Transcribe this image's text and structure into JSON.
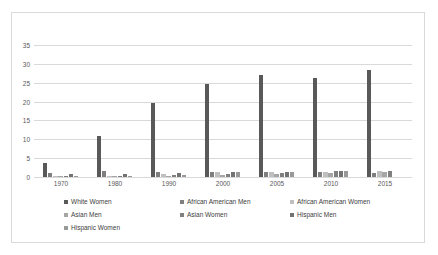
{
  "chart_data": {
    "type": "bar",
    "title": "",
    "xlabel": "",
    "ylabel": "",
    "ylim": [
      0,
      35
    ],
    "ytick_values": [
      0,
      5,
      10,
      15,
      20,
      25,
      30,
      35
    ],
    "ytick_labels": [
      "0",
      "5",
      "10",
      "15",
      "20",
      "25",
      "30",
      "35"
    ],
    "grid": true,
    "legend_position": "bottom",
    "x": [
      1967,
      1968,
      1969,
      1970,
      1971,
      1972,
      1973,
      1974,
      1976,
      1977,
      1978,
      1979,
      1980,
      1981,
      1982,
      1983,
      1986,
      1987,
      1988,
      1989,
      1990,
      1991,
      1992,
      1993,
      1996,
      1997,
      1998,
      1999,
      2000,
      2001,
      2002,
      2003,
      2004,
      2005,
      2006,
      2007,
      2008,
      2009,
      2010,
      2011,
      2012,
      2013,
      2014,
      2015,
      2016,
      2017
    ],
    "xtick_labels": [
      "1970",
      "1980",
      "1990",
      "2000",
      "2005",
      "2010",
      "2015"
    ],
    "xtick_positions": [
      1970,
      1980,
      1990,
      2000,
      2005,
      2010,
      2015
    ],
    "series": [
      {
        "name": "White Women",
        "color": "#595959",
        "values": [
          3.7,
          0,
          0,
          0,
          0,
          0,
          0,
          0,
          11.0,
          0,
          0,
          0,
          0,
          0,
          0,
          0,
          19.7,
          0,
          0,
          0,
          0,
          0,
          0,
          0,
          24.7,
          0,
          0,
          0,
          0,
          0,
          0,
          27.0,
          0,
          0,
          0,
          0,
          26.3,
          0,
          0,
          0,
          0,
          28.3,
          0,
          0,
          0,
          0
        ]
      },
      {
        "name": "African American Men",
        "color": "#7f7f7f",
        "values": [
          0,
          1.0,
          0,
          0,
          0,
          0,
          0,
          0,
          0,
          1.5,
          0,
          0,
          0,
          0,
          0,
          0,
          0,
          1.3,
          0,
          0,
          0,
          0,
          0,
          0,
          0,
          1.3,
          0,
          0,
          0,
          0,
          0,
          0,
          1.2,
          0,
          0,
          0,
          0,
          1.2,
          0,
          0,
          0,
          0,
          1.1,
          0,
          0,
          0
        ]
      },
      {
        "name": "African American Women",
        "color": "#bfbfbf",
        "values": [
          0,
          0,
          0.2,
          0,
          0,
          0,
          0,
          0,
          0,
          0,
          0.3,
          0,
          0,
          0,
          0,
          0,
          0,
          0,
          0.8,
          0,
          0,
          0,
          0,
          0,
          0,
          0,
          1.2,
          0,
          0,
          0,
          0,
          0,
          0,
          1.3,
          0,
          0,
          0,
          0,
          1.4,
          0,
          0,
          0,
          0,
          1.5,
          0,
          0
        ]
      },
      {
        "name": "Asian Men",
        "color": "#a6a6a6",
        "values": [
          0,
          0,
          0,
          0.2,
          0,
          0,
          0,
          0,
          0,
          0,
          0,
          0.3,
          0,
          0,
          0,
          0,
          0,
          0,
          0,
          0.4,
          0,
          0,
          0,
          0,
          0,
          0,
          0,
          0.6,
          0,
          0,
          0,
          0,
          0,
          0,
          0.9,
          0,
          0,
          0,
          0,
          1.0,
          0,
          0,
          0,
          0,
          1.2,
          0
        ]
      },
      {
        "name": "Asian Women",
        "color": "#808080",
        "values": [
          0,
          0,
          0,
          0,
          0.1,
          0,
          0,
          0,
          0,
          0,
          0,
          0,
          0.3,
          0,
          0,
          0,
          0,
          0,
          0,
          0,
          0.5,
          0,
          0,
          0,
          0,
          0,
          0,
          0,
          0.8,
          0,
          0,
          0,
          0,
          0,
          0,
          1.1,
          0,
          0,
          0,
          0,
          1.5,
          0,
          0,
          0,
          0,
          1.6
        ]
      },
      {
        "name": "Hispanic Men",
        "color": "#737373",
        "values": [
          0,
          0,
          0,
          0,
          0,
          0.8,
          0,
          0,
          0,
          0,
          0,
          0,
          0,
          0.9,
          0,
          0,
          0,
          0,
          0,
          0,
          0,
          1.0,
          0,
          0,
          0,
          0,
          0,
          0,
          0,
          1.2,
          0,
          0,
          0,
          0,
          0,
          0,
          1.4,
          0,
          0,
          0,
          0,
          0,
          1.5,
          0,
          0,
          0
        ]
      },
      {
        "name": "Hispanic Women",
        "color": "#999999",
        "values": [
          0,
          0,
          0,
          0,
          0,
          0,
          0.2,
          0,
          0,
          0,
          0,
          0,
          0,
          0,
          0.2,
          0,
          0,
          0,
          0,
          0,
          0,
          0,
          0.6,
          0,
          0,
          0,
          0,
          0,
          0,
          0,
          1.2,
          0,
          0,
          0,
          0,
          0,
          0,
          1.3,
          0,
          0,
          0,
          0,
          0,
          1.5,
          0,
          0
        ]
      }
    ],
    "bars": [
      {
        "x": 1967,
        "value": 3.7,
        "series": "White Women",
        "color": "#595959"
      },
      {
        "x": 1968,
        "value": 1.0,
        "series": "African American Men",
        "color": "#7f7f7f"
      },
      {
        "x": 1969,
        "value": 0.2,
        "series": "African American Women",
        "color": "#bfbfbf"
      },
      {
        "x": 1970,
        "value": 0.2,
        "series": "Asian Men",
        "color": "#a6a6a6"
      },
      {
        "x": 1971,
        "value": 0.1,
        "series": "Asian Women",
        "color": "#808080"
      },
      {
        "x": 1972,
        "value": 0.8,
        "series": "Hispanic Men",
        "color": "#737373"
      },
      {
        "x": 1973,
        "value": 0.2,
        "series": "Hispanic Women",
        "color": "#999999"
      },
      {
        "x": 1976,
        "value": 11.0,
        "series": "White Women",
        "color": "#595959"
      },
      {
        "x": 1977,
        "value": 1.5,
        "series": "African American Men",
        "color": "#7f7f7f"
      },
      {
        "x": 1978,
        "value": 0.3,
        "series": "African American Women",
        "color": "#bfbfbf"
      },
      {
        "x": 1979,
        "value": 0.3,
        "series": "Asian Men",
        "color": "#a6a6a6"
      },
      {
        "x": 1980,
        "value": 0.3,
        "series": "Asian Women",
        "color": "#808080"
      },
      {
        "x": 1981,
        "value": 0.9,
        "series": "Hispanic Men",
        "color": "#737373"
      },
      {
        "x": 1982,
        "value": 0.2,
        "series": "Hispanic Women",
        "color": "#999999"
      },
      {
        "x": 1986,
        "value": 19.7,
        "series": "White Women",
        "color": "#595959"
      },
      {
        "x": 1987,
        "value": 1.3,
        "series": "African American Men",
        "color": "#7f7f7f"
      },
      {
        "x": 1988,
        "value": 0.8,
        "series": "African American Women",
        "color": "#bfbfbf"
      },
      {
        "x": 1989,
        "value": 0.4,
        "series": "Asian Men",
        "color": "#a6a6a6"
      },
      {
        "x": 1990,
        "value": 0.5,
        "series": "Asian Women",
        "color": "#808080"
      },
      {
        "x": 1991,
        "value": 1.0,
        "series": "Hispanic Men",
        "color": "#737373"
      },
      {
        "x": 1992,
        "value": 0.6,
        "series": "Hispanic Women",
        "color": "#999999"
      },
      {
        "x": 1996,
        "value": 24.7,
        "series": "White Women",
        "color": "#595959"
      },
      {
        "x": 1997,
        "value": 1.3,
        "series": "African American Men",
        "color": "#7f7f7f"
      },
      {
        "x": 1998,
        "value": 1.2,
        "series": "African American Women",
        "color": "#bfbfbf"
      },
      {
        "x": 1999,
        "value": 0.6,
        "series": "Asian Men",
        "color": "#a6a6a6"
      },
      {
        "x": 2000,
        "value": 0.8,
        "series": "Asian Women",
        "color": "#808080"
      },
      {
        "x": 2001,
        "value": 1.2,
        "series": "Hispanic Men",
        "color": "#737373"
      },
      {
        "x": 2002,
        "value": 1.2,
        "series": "Hispanic Women",
        "color": "#999999"
      },
      {
        "x": 2003,
        "value": 27.0,
        "series": "White Women",
        "color": "#595959"
      },
      {
        "x": 2004,
        "value": 1.2,
        "series": "African American Men",
        "color": "#7f7f7f"
      },
      {
        "x": 2005,
        "value": 1.3,
        "series": "African American Women",
        "color": "#bfbfbf"
      },
      {
        "x": 2006,
        "value": 0.9,
        "series": "Asian Men",
        "color": "#a6a6a6"
      },
      {
        "x": 2007,
        "value": 1.1,
        "series": "Asian Women",
        "color": "#808080"
      },
      {
        "x": 2008,
        "value": 1.4,
        "series": "Hispanic Men",
        "color": "#737373"
      },
      {
        "x": 2009,
        "value": 1.3,
        "series": "Hispanic Women",
        "color": "#999999"
      },
      {
        "x": 2008,
        "value": 26.3,
        "series": "White Women",
        "color": "#595959"
      },
      {
        "x": 2009,
        "value": 1.2,
        "series": "African American Men",
        "color": "#7f7f7f"
      },
      {
        "x": 2010,
        "value": 1.4,
        "series": "African American Women",
        "color": "#bfbfbf"
      },
      {
        "x": 2011,
        "value": 1.0,
        "series": "Asian Men",
        "color": "#a6a6a6"
      },
      {
        "x": 2012,
        "value": 1.5,
        "series": "Asian Women",
        "color": "#808080"
      },
      {
        "x": 2013,
        "value": 1.5,
        "series": "Hispanic Men",
        "color": "#737373"
      },
      {
        "x": 2014,
        "value": 1.5,
        "series": "Hispanic Women",
        "color": "#999999"
      },
      {
        "x": 2013,
        "value": 28.3,
        "series": "White Women",
        "color": "#595959"
      },
      {
        "x": 2014,
        "value": 1.1,
        "series": "African American Men",
        "color": "#7f7f7f"
      },
      {
        "x": 2015,
        "value": 1.5,
        "series": "African American Women",
        "color": "#bfbfbf"
      },
      {
        "x": 2016,
        "value": 1.2,
        "series": "Asian Men",
        "color": "#a6a6a6"
      },
      {
        "x": 2017,
        "value": 1.6,
        "series": "Asian Women",
        "color": "#808080"
      },
      {
        "x": 2018,
        "value": 1.5,
        "series": "Hispanic Men",
        "color": "#737373"
      },
      {
        "x": 2019,
        "value": 1.5,
        "series": "Hispanic Women",
        "color": "#999999"
      }
    ]
  },
  "legend": {
    "rows": [
      [
        {
          "label": "White Women",
          "color": "#595959"
        },
        {
          "label": "African American Men",
          "color": "#7f7f7f"
        },
        {
          "label": "African American Women",
          "color": "#bfbfbf"
        }
      ],
      [
        {
          "label": "Asian Men",
          "color": "#a6a6a6"
        },
        {
          "label": "Asian Women",
          "color": "#808080"
        },
        {
          "label": "Hispanic Men",
          "color": "#737373"
        }
      ],
      [
        {
          "label": "Hispanic Women",
          "color": "#999999"
        }
      ]
    ]
  }
}
